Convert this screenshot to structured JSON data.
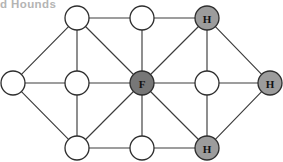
{
  "figure": {
    "caption_fragment": "d Hounds",
    "background_color": "#ffffff"
  },
  "legend_tokens": {
    "fox_label": "F",
    "hound_label": "H",
    "empty_label": ""
  },
  "colors": {
    "node_white": "#ffffff",
    "node_hound": "#9c9c9c",
    "node_fox": "#777777",
    "node_stroke": "#2e2e2e",
    "edge_stroke": "#3c3c3c",
    "label_text": "#111111",
    "caption_text": "#b4b4b4"
  },
  "chart_data": {
    "type": "diagram",
    "title": "d Hounds",
    "subtype": "undirected-graph",
    "node_radius": 12,
    "nodes": [
      {
        "id": "n-top-left",
        "label": "",
        "x": 77,
        "y": 18,
        "fill": "white",
        "role": "empty"
      },
      {
        "id": "n-top-mid",
        "label": "",
        "x": 142,
        "y": 18,
        "fill": "white",
        "role": "empty"
      },
      {
        "id": "n-top-right",
        "label": "H",
        "x": 207,
        "y": 18,
        "fill": "hound",
        "role": "hound"
      },
      {
        "id": "n-mid-far-left",
        "label": "",
        "x": 13,
        "y": 83,
        "fill": "white",
        "role": "empty"
      },
      {
        "id": "n-mid-left",
        "label": "",
        "x": 77,
        "y": 83,
        "fill": "white",
        "role": "empty"
      },
      {
        "id": "n-mid-center",
        "label": "F",
        "x": 142,
        "y": 83,
        "fill": "fox",
        "role": "fox"
      },
      {
        "id": "n-mid-right",
        "label": "",
        "x": 207,
        "y": 83,
        "fill": "white",
        "role": "empty"
      },
      {
        "id": "n-mid-far-right",
        "label": "H",
        "x": 270,
        "y": 83,
        "fill": "hound",
        "role": "hound"
      },
      {
        "id": "n-bot-left",
        "label": "",
        "x": 77,
        "y": 148,
        "fill": "white",
        "role": "empty"
      },
      {
        "id": "n-bot-mid",
        "label": "",
        "x": 142,
        "y": 148,
        "fill": "white",
        "role": "empty"
      },
      {
        "id": "n-bot-right",
        "label": "H",
        "x": 207,
        "y": 148,
        "fill": "hound",
        "role": "hound"
      }
    ],
    "edges": [
      {
        "from": "n-top-left",
        "to": "n-top-mid"
      },
      {
        "from": "n-top-mid",
        "to": "n-top-right"
      },
      {
        "from": "n-top-left",
        "to": "n-mid-left"
      },
      {
        "from": "n-top-mid",
        "to": "n-mid-center"
      },
      {
        "from": "n-top-right",
        "to": "n-mid-right"
      },
      {
        "from": "n-top-left",
        "to": "n-mid-far-left"
      },
      {
        "from": "n-top-left",
        "to": "n-mid-center"
      },
      {
        "from": "n-top-right",
        "to": "n-mid-center"
      },
      {
        "from": "n-top-right",
        "to": "n-mid-far-right"
      },
      {
        "from": "n-mid-far-left",
        "to": "n-mid-left"
      },
      {
        "from": "n-mid-left",
        "to": "n-mid-center"
      },
      {
        "from": "n-mid-center",
        "to": "n-mid-right"
      },
      {
        "from": "n-mid-right",
        "to": "n-mid-far-right"
      },
      {
        "from": "n-mid-far-left",
        "to": "n-bot-left"
      },
      {
        "from": "n-mid-left",
        "to": "n-bot-left"
      },
      {
        "from": "n-mid-center",
        "to": "n-bot-mid"
      },
      {
        "from": "n-mid-right",
        "to": "n-bot-right"
      },
      {
        "from": "n-mid-center",
        "to": "n-bot-left"
      },
      {
        "from": "n-mid-center",
        "to": "n-bot-right"
      },
      {
        "from": "n-bot-left",
        "to": "n-bot-mid"
      },
      {
        "from": "n-bot-mid",
        "to": "n-bot-right"
      },
      {
        "from": "n-bot-right",
        "to": "n-mid-far-right"
      }
    ],
    "grid": {
      "on": false
    },
    "legend": {
      "position": "none"
    }
  }
}
